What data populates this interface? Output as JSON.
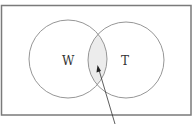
{
  "diagram": {
    "type": "venn",
    "sets": [
      {
        "label": "W",
        "cx": 68,
        "cy": 59,
        "r": 39
      },
      {
        "label": "T",
        "cx": 126,
        "cy": 60,
        "r": 38
      }
    ],
    "intersection_shaded": true,
    "colors": {
      "stroke": "#8a8a8a",
      "frame": "#7a7a7a",
      "shade": "#ececec",
      "arrow": "#333333"
    }
  }
}
